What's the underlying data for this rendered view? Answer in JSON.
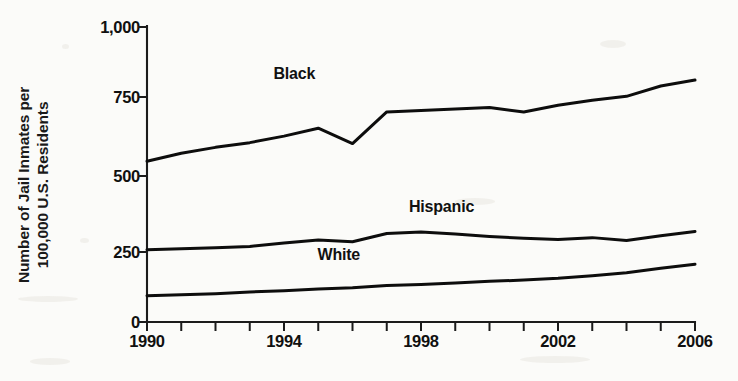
{
  "chart_data": {
    "type": "line",
    "title": "",
    "xlabel": "",
    "ylabel": "Number of Jail Inmates per\n100,000 U.S. Residents",
    "x": [
      1990,
      1991,
      1992,
      1993,
      1994,
      1995,
      1996,
      1997,
      1998,
      1999,
      2000,
      2001,
      2002,
      2003,
      2004,
      2005,
      2006
    ],
    "xlim": [
      1990,
      2006
    ],
    "ylim": [
      0,
      1000
    ],
    "yticks": [
      0,
      250,
      500,
      750,
      1000
    ],
    "ytick_labels": [
      "0",
      "250",
      "500",
      "750",
      "1,000"
    ],
    "xticks": [
      1990,
      1991,
      1992,
      1993,
      1994,
      1995,
      1996,
      1997,
      1998,
      1999,
      2000,
      2001,
      2002,
      2003,
      2004,
      2005,
      2006
    ],
    "xtick_labels_shown": [
      "1990",
      "1994",
      "1998",
      "2002",
      "2006"
    ],
    "xtick_labels_shown_values": [
      1990,
      1994,
      1998,
      2002,
      2006
    ],
    "grid": false,
    "legend": "inline-labels",
    "series": [
      {
        "name": "Black",
        "label_x": 1994.3,
        "label_y": 840,
        "values": [
          545,
          572,
          592,
          608,
          630,
          657,
          605,
          712,
          717,
          722,
          727,
          712,
          735,
          752,
          765,
          800,
          820
        ]
      },
      {
        "name": "Hispanic",
        "label_x": 1998.6,
        "label_y": 390,
        "values": [
          245,
          248,
          252,
          256,
          268,
          278,
          272,
          300,
          305,
          298,
          290,
          284,
          280,
          286,
          276,
          292,
          307
        ]
      },
      {
        "name": "White",
        "label_x": 1995.6,
        "label_y": 228,
        "values": [
          89,
          92,
          96,
          102,
          106,
          112,
          116,
          124,
          127,
          132,
          138,
          142,
          148,
          157,
          167,
          182,
          196
        ]
      }
    ]
  }
}
